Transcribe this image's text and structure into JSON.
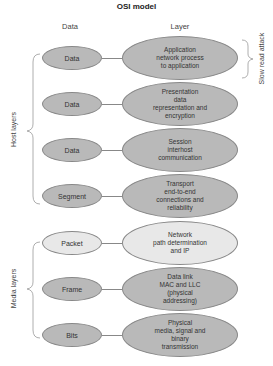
{
  "title": "OSI model",
  "columns": {
    "data": "Data",
    "layer": "Layer"
  },
  "colors": {
    "host_fill": "#b9b9b9",
    "media_fill": "#e8e8e8",
    "stroke": "#888888"
  },
  "rows": [
    {
      "data": "Data",
      "layer": "Application\nnetwork process\nto application"
    },
    {
      "data": "Data",
      "layer": "Presentation\ndata\nrepresentation and\nencryption"
    },
    {
      "data": "Data",
      "layer": "Session\ninterhost\ncommunication"
    },
    {
      "data": "Segment",
      "layer": "Transport\nend-to-end\nconnections and\nreliability"
    },
    {
      "data": "Packet",
      "layer": "Network\npath determination\nand IP"
    },
    {
      "data": "Frame",
      "layer": "Data link\nMAC and LLC\n(physical\naddressing)"
    },
    {
      "data": "Bits",
      "layer": "Physical\nmedia, signal and\nbinary\ntransmission"
    }
  ],
  "groups": {
    "host": "Host layers",
    "media": "Media layers",
    "attack": "Slow read attack"
  }
}
